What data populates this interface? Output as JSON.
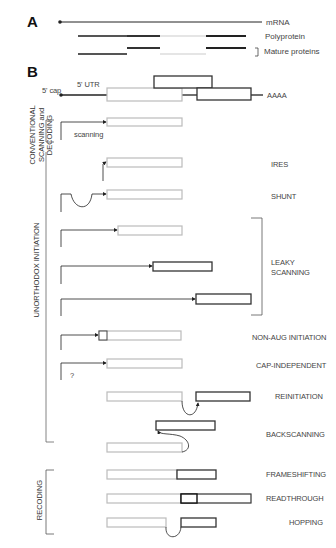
{
  "panel_a": {
    "letter": "A",
    "mrna_label": "mRNA",
    "polyprotein_label": "Polyprotein",
    "mature_label": "Mature proteins"
  },
  "panel_b": {
    "letter": "B",
    "cap_label": "5' cap",
    "utr_label": "5' UTR",
    "orf1": "ORF1",
    "orf2": "ORF2",
    "orf3": "ORF3",
    "polya": "AAAA",
    "scanning_label": "scanning",
    "question_mark": "?"
  },
  "groups": {
    "conventional": [
      "CONVENTIONAL",
      "SCANNING and",
      "DECODING"
    ],
    "unorthodox": "UNORTHODOX INITIATION",
    "recoding": "RECODING"
  },
  "mechanisms": [
    {
      "id": "ires",
      "label": "IRES"
    },
    {
      "id": "shunt",
      "label": "SHUNT"
    },
    {
      "id": "leaky",
      "label_lines": [
        "LEAKY",
        "SCANNING"
      ]
    },
    {
      "id": "non-aug",
      "label": "NON-AUG INITIATION"
    },
    {
      "id": "cap-independent",
      "label": "CAP-INDEPENDENT"
    },
    {
      "id": "reinitiation",
      "label": "REINITIATION"
    },
    {
      "id": "backscanning",
      "label": "BACKSCANNING"
    },
    {
      "id": "frameshifting",
      "label": "FRAMESHIFTING"
    },
    {
      "id": "readthrough",
      "label": "READTHROUGH"
    },
    {
      "id": "hopping",
      "label": "HOPPING"
    }
  ],
  "colors": {
    "light_orf": "#b8b8b8",
    "dark_orf": "#333333",
    "line": "#222222"
  }
}
